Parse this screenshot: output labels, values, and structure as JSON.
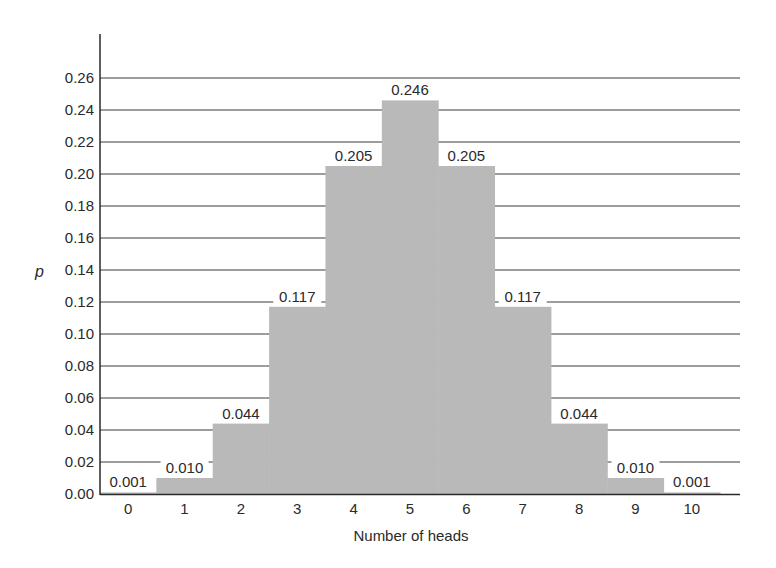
{
  "chart_data": {
    "type": "bar",
    "title": "",
    "xlabel": "Number of heads",
    "ylabel": "p",
    "categories": [
      "0",
      "1",
      "2",
      "3",
      "4",
      "5",
      "6",
      "7",
      "8",
      "9",
      "10"
    ],
    "values": [
      0.001,
      0.01,
      0.044,
      0.117,
      0.205,
      0.246,
      0.205,
      0.117,
      0.044,
      0.01,
      0.001
    ],
    "value_labels": [
      "0.001",
      "0.010",
      "0.044",
      "0.117",
      "0.205",
      "0.246",
      "0.205",
      "0.117",
      "0.044",
      "0.010",
      "0.001"
    ],
    "yticks": [
      "0.00",
      "0.02",
      "0.04",
      "0.06",
      "0.08",
      "0.10",
      "0.12",
      "0.14",
      "0.16",
      "0.18",
      "0.20",
      "0.22",
      "0.24",
      "0.26"
    ],
    "ylim": [
      0,
      0.26
    ],
    "grid": true,
    "bar_color": "#b9b9b9",
    "grid_color": "#3a3a3a",
    "legend": null
  }
}
